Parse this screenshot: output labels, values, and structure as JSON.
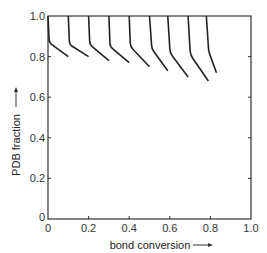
{
  "chart_data": {
    "type": "line",
    "title": "",
    "xlabel": "bond conversion",
    "ylabel": "PDB fraction",
    "xlim": [
      0,
      1.0
    ],
    "ylim": [
      0,
      1.0
    ],
    "x_ticks": [
      "0",
      "0.2",
      "0.4",
      "0.6",
      "0.8",
      "1.0"
    ],
    "y_ticks": [
      "0",
      "0.2",
      "0.4",
      "0.6",
      "0.8",
      "1.0"
    ],
    "grid": false,
    "legend": null,
    "series": [
      {
        "name": "start 0.0",
        "x": [
          0.0,
          0.005,
          0.1
        ],
        "y": [
          1.0,
          0.87,
          0.8
        ]
      },
      {
        "name": "start 0.1",
        "x": [
          0.1,
          0.105,
          0.2
        ],
        "y": [
          1.0,
          0.86,
          0.8
        ]
      },
      {
        "name": "start 0.2",
        "x": [
          0.2,
          0.205,
          0.3
        ],
        "y": [
          1.0,
          0.86,
          0.78
        ]
      },
      {
        "name": "start 0.3",
        "x": [
          0.3,
          0.305,
          0.4
        ],
        "y": [
          1.0,
          0.85,
          0.77
        ]
      },
      {
        "name": "start 0.4",
        "x": [
          0.4,
          0.405,
          0.5
        ],
        "y": [
          1.0,
          0.85,
          0.75
        ]
      },
      {
        "name": "start 0.5",
        "x": [
          0.5,
          0.51,
          0.59
        ],
        "y": [
          1.0,
          0.84,
          0.73
        ]
      },
      {
        "name": "start 0.6",
        "x": [
          0.59,
          0.6,
          0.69
        ],
        "y": [
          1.0,
          0.82,
          0.7
        ]
      },
      {
        "name": "start 0.7",
        "x": [
          0.69,
          0.7,
          0.79
        ],
        "y": [
          1.0,
          0.81,
          0.68
        ]
      },
      {
        "name": "start 0.78",
        "x": [
          0.78,
          0.79,
          0.83
        ],
        "y": [
          1.0,
          0.83,
          0.72
        ]
      }
    ]
  },
  "axes": {
    "x_label": "bond conversion",
    "y_label": "PDB fraction",
    "x_arrow": "→",
    "y_arrow": "→"
  }
}
